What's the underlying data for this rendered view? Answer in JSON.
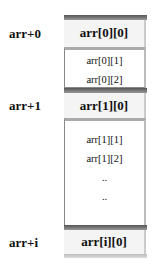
{
  "pointers": [
    {
      "label": "arr+0",
      "row": 0
    },
    {
      "label": "arr+1",
      "row": 1
    },
    {
      "label": "arr+i",
      "row": "i"
    }
  ],
  "rows": [
    {
      "head": "arr[0][0]",
      "rest": [
        "arr[0][1]",
        "arr[0][2]"
      ]
    },
    {
      "head": "arr[1][0]",
      "rest": [
        "arr[1][1]",
        "arr[1][2]",
        "..",
        ".."
      ]
    },
    {
      "head": "arr[i][0]",
      "rest": []
    }
  ]
}
